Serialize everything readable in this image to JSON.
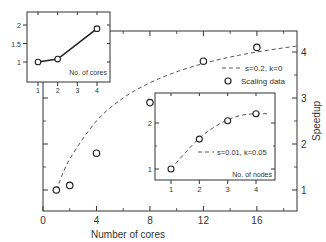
{
  "chart_data": [
    {
      "id": "main",
      "type": "scatter",
      "title": "",
      "xlabel": "Number of cores",
      "ylabel": "Speedup",
      "ylabel_position": "right",
      "xlim": [
        0,
        19
      ],
      "ylim": [
        0.6,
        4.5
      ],
      "x_ticks": [
        0,
        4,
        8,
        12,
        16
      ],
      "y_ticks": [
        1,
        2,
        3,
        4
      ],
      "grid": false,
      "series": [
        {
          "name": "Scaling data",
          "style": "open-circle",
          "x": [
            1,
            2,
            4,
            8,
            12,
            16
          ],
          "y": [
            1.0,
            1.1,
            1.8,
            2.9,
            3.8,
            4.1
          ]
        },
        {
          "name": "s=0.2, k=0",
          "style": "dashed",
          "x": [
            1,
            2,
            4,
            6,
            8,
            10,
            12,
            14,
            16,
            18,
            19
          ],
          "y": [
            1.0,
            1.67,
            2.5,
            3.0,
            3.33,
            3.57,
            3.75,
            3.89,
            4.0,
            4.09,
            4.13
          ]
        }
      ],
      "legend": {
        "position": "upper right",
        "entries": [
          "s=0.2, k=0",
          "Scaling data"
        ]
      }
    },
    {
      "id": "inset-cores",
      "type": "line",
      "xlabel": "No. of cores",
      "xlim": [
        0.5,
        4.5
      ],
      "ylim": [
        0.6,
        2.2
      ],
      "x_ticks": [
        1,
        2,
        3,
        4
      ],
      "y_ticks": [
        1,
        1.5,
        2
      ],
      "y_tick_labels": [
        "1",
        "1.5",
        "2"
      ],
      "series": [
        {
          "name": "cores",
          "style": "solid-with-open-circles",
          "x": [
            1,
            2,
            4
          ],
          "y": [
            1.0,
            1.08,
            1.9
          ]
        }
      ]
    },
    {
      "id": "inset-nodes",
      "type": "scatter",
      "xlabel": "No. of nodes",
      "xlim": [
        0.5,
        4.5
      ],
      "ylim": [
        0.5,
        2.8
      ],
      "x_ticks": [
        1,
        2,
        3,
        4
      ],
      "y_ticks": [
        1,
        2
      ],
      "series": [
        {
          "name": "nodes data",
          "style": "open-circle",
          "x": [
            1,
            2,
            3,
            4
          ],
          "y": [
            1.0,
            1.65,
            2.05,
            2.2
          ]
        },
        {
          "name": "s=0.01, k=0.05",
          "style": "dashed",
          "x": [
            1,
            1.5,
            2,
            2.5,
            3,
            3.5,
            4,
            4.5
          ],
          "y": [
            1.0,
            1.35,
            1.67,
            1.9,
            2.07,
            2.17,
            2.2,
            2.2
          ]
        }
      ],
      "legend": {
        "position": "center right",
        "entries": [
          "s=0.01, k=0.05"
        ]
      }
    }
  ],
  "labels": {
    "main_xlabel": "Number of cores",
    "main_ylabel": "Speedup",
    "main_xticks": [
      "0",
      "4",
      "8",
      "12",
      "16"
    ],
    "main_yticks": [
      "1",
      "2",
      "3",
      "4"
    ],
    "legend_fit": "s=0.2, k=0",
    "legend_data": "Scaling data",
    "inset1_xlabel": "No. of cores",
    "inset1_xticks": [
      "1",
      "2",
      "3",
      "4"
    ],
    "inset1_yticks": [
      "1",
      "1.5",
      "2"
    ],
    "inset2_xlabel": "No. of nodes",
    "inset2_xticks": [
      "1",
      "2",
      "3",
      "4"
    ],
    "inset2_yticks": [
      "1",
      "2"
    ],
    "inset2_legend": "s=0.01, k=0.05"
  },
  "colors": {
    "axis": "#333333",
    "line": "#222222",
    "dashed": "#555555",
    "marker": "#222222"
  }
}
